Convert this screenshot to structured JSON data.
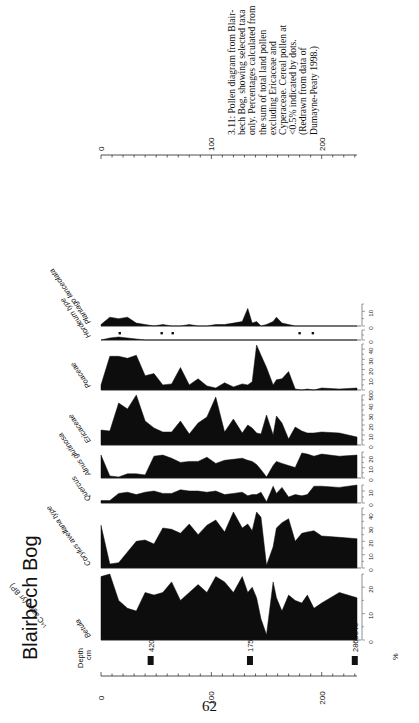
{
  "page": {
    "title": "Blairbech Bog",
    "page_number": "62",
    "caption_lines": [
      "3.11: Pollen diagram from Blair-",
      "bech Bog, showing selected taxa",
      "only. Percentages calculated from",
      "the sum of total land pollen",
      "excluding Ericaceae and",
      "Cyperaceae. Cereal pollen at",
      "<0.5% indicated by dots.",
      "(Redrawn from data of",
      "Dumayne-Peaty 1998.)"
    ],
    "depth_label_line1": "Depth",
    "depth_label_line2": "cm",
    "c14_label": "¹⁴C ages (yr BP)",
    "percent_label": "%"
  },
  "chart_data": {
    "type": "area",
    "title": "Blairbech Bog",
    "xlabel": "Depth cm",
    "ylabel": "%",
    "depth_range": [
      0,
      232
    ],
    "depth_ticks": [
      0,
      100,
      200
    ],
    "radiocarbon_dates": [
      {
        "depth": 45,
        "label": "420±45"
      },
      {
        "depth": 135,
        "label": "1750±45"
      },
      {
        "depth": 230,
        "label": "2865±40"
      }
    ],
    "depths": [
      0,
      8,
      16,
      24,
      32,
      40,
      48,
      56,
      64,
      72,
      80,
      88,
      96,
      104,
      112,
      120,
      128,
      133,
      137,
      141,
      145,
      150,
      156,
      159,
      164,
      170,
      176,
      182,
      187,
      193,
      200,
      216,
      232
    ],
    "series": [
      {
        "name": "Betula",
        "max": 25,
        "ticks": [
          0,
          10,
          20
        ],
        "values": [
          24,
          25,
          15,
          12,
          11,
          18,
          17,
          18,
          22,
          15,
          18,
          21,
          18,
          24,
          22,
          18,
          24,
          18,
          20,
          16,
          8,
          2,
          22,
          16,
          11,
          17,
          15,
          14,
          17,
          12,
          14,
          18,
          16
        ]
      },
      {
        "name": "Corylus avellana type",
        "max": 45,
        "ticks": [
          0,
          10,
          20,
          30,
          40
        ],
        "values": [
          32,
          3,
          4,
          12,
          20,
          21,
          18,
          30,
          29,
          26,
          33,
          25,
          32,
          36,
          27,
          42,
          30,
          33,
          28,
          42,
          38,
          2,
          16,
          30,
          34,
          37,
          20,
          26,
          27,
          28,
          24,
          23,
          22
        ]
      },
      {
        "name": "Quercus",
        "max": 15,
        "ticks": [
          0,
          10
        ],
        "values": [
          2,
          2,
          8,
          9,
          7,
          9,
          10,
          8,
          8,
          11,
          10,
          10,
          9,
          10,
          7,
          8,
          9,
          6,
          7,
          7,
          9,
          1,
          14,
          8,
          13,
          5,
          7,
          6,
          7,
          14,
          14,
          13,
          15
        ]
      },
      {
        "name": "Alnus glutinosa",
        "max": 25,
        "ticks": [
          0,
          10,
          20
        ],
        "values": [
          22,
          2,
          1,
          4,
          4,
          3,
          21,
          22,
          19,
          15,
          16,
          16,
          20,
          14,
          17,
          18,
          19,
          17,
          16,
          13,
          8,
          1,
          12,
          16,
          14,
          12,
          10,
          24,
          23,
          21,
          23,
          21,
          22
        ]
      },
      {
        "name": "Ericaceae",
        "max": 50,
        "ticks": [
          0,
          10,
          20,
          30,
          40,
          50
        ],
        "values": [
          15,
          14,
          42,
          36,
          55,
          24,
          17,
          13,
          13,
          24,
          11,
          22,
          28,
          48,
          13,
          26,
          12,
          20,
          17,
          12,
          11,
          30,
          10,
          29,
          22,
          6,
          18,
          14,
          12,
          12,
          13,
          12,
          8
        ]
      },
      {
        "name": "Poaceae",
        "max": 45,
        "ticks": [
          0,
          10,
          20,
          30,
          40
        ],
        "values": [
          5,
          33,
          33,
          31,
          34,
          14,
          16,
          5,
          6,
          22,
          5,
          11,
          4,
          2,
          7,
          3,
          6,
          5,
          8,
          44,
          34,
          22,
          5,
          10,
          11,
          18,
          1,
          0,
          1,
          0,
          2,
          1,
          2
        ]
      },
      {
        "name": "Hordeum type",
        "max": 10,
        "ticks": [
          0
        ],
        "values": [
          0,
          2,
          3,
          2,
          1,
          0,
          0,
          0,
          0,
          0,
          0,
          0,
          0,
          0,
          0,
          0,
          0,
          0,
          0,
          0,
          0,
          0,
          0,
          0,
          0,
          0,
          0,
          0,
          0,
          0,
          0,
          0,
          0
        ],
        "dots_depth": [
          17,
          55,
          65,
          180,
          192
        ]
      },
      {
        "name": "Plantago lanceolata",
        "max": 15,
        "ticks": [
          0,
          10
        ],
        "values": [
          1,
          6,
          5,
          6,
          2,
          1,
          0,
          1,
          0,
          0,
          1,
          0,
          0,
          1,
          1,
          2,
          3,
          12,
          2,
          3,
          0,
          1,
          3,
          6,
          2,
          1,
          0,
          0,
          0,
          0,
          0,
          0,
          0
        ]
      }
    ]
  }
}
